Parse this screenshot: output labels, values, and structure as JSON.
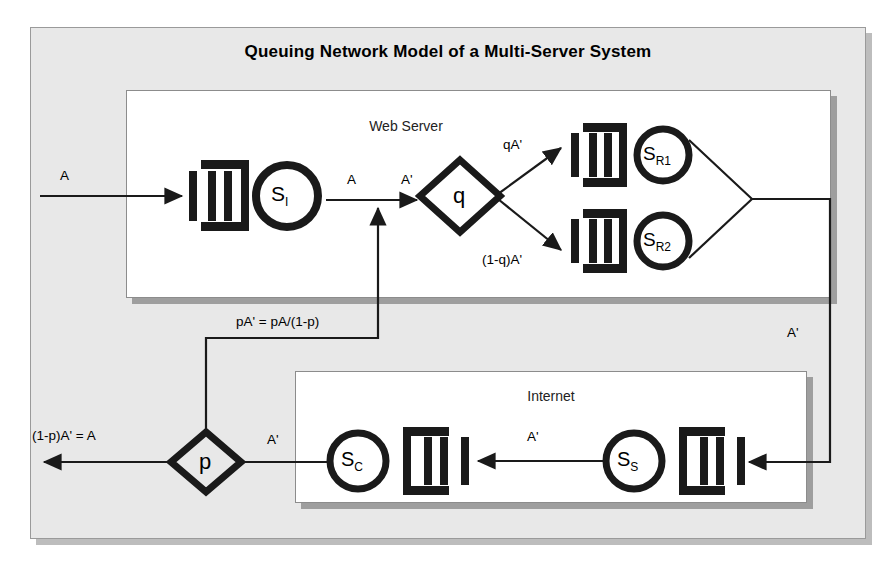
{
  "title": "Queuing Network Model of a Multi-Server System",
  "panels": {
    "web_server": {
      "label": "Web Server"
    },
    "internet": {
      "label": "Internet"
    }
  },
  "nodes": {
    "server_i": {
      "label": "S",
      "sub": "I",
      "icon": "queue-icon"
    },
    "server_r1": {
      "label": "S",
      "sub": "R1",
      "icon": "queue-icon"
    },
    "server_r2": {
      "label": "S",
      "sub": "R2",
      "icon": "queue-icon"
    },
    "server_c": {
      "label": "S",
      "sub": "C",
      "icon": "queue-icon"
    },
    "server_s": {
      "label": "S",
      "sub": "S",
      "icon": "queue-icon"
    },
    "branch_q": {
      "label": "q",
      "icon": "diamond-icon"
    },
    "branch_p": {
      "label": "p",
      "icon": "diamond-icon"
    }
  },
  "flows": {
    "arrival_a": "A",
    "web_in_a": "A",
    "web_in_aprime": "A'",
    "to_r1": "qA'",
    "to_r2": "(1-q)A'",
    "merge_return": "A'",
    "internet_mid": "A'",
    "to_p": "A'",
    "departure": "(1-p)A' = A",
    "feedback": "pA' = pA/(1-p)"
  },
  "colors": {
    "frame_bg": "#e8e8e8",
    "panel_bg": "#ffffff",
    "stroke": "#1a1a1a",
    "shadow": "#9e9e9e"
  }
}
